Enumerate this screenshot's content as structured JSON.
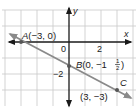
{
  "diagram": {
    "type": "coordinate-plane-line",
    "axes": {
      "x_label": "x",
      "y_label": "y",
      "origin_label": "0"
    },
    "tick_labels": {
      "x": "2",
      "y": "−2"
    },
    "points": [
      {
        "name": "A",
        "coords": "(−3, 0)",
        "x": -3,
        "y": 0
      },
      {
        "name": "B",
        "coords": "(0, −1",
        "fraction_num": "1",
        "fraction_den": "2",
        "x": 0,
        "y": -1.5
      },
      {
        "name": "C",
        "coords": "(3, −3)",
        "x": 3,
        "y": -3
      }
    ],
    "colors": {
      "grid": "#c8c8c8",
      "axis": "#1a1a1a",
      "line": "#8a8a8a"
    }
  }
}
